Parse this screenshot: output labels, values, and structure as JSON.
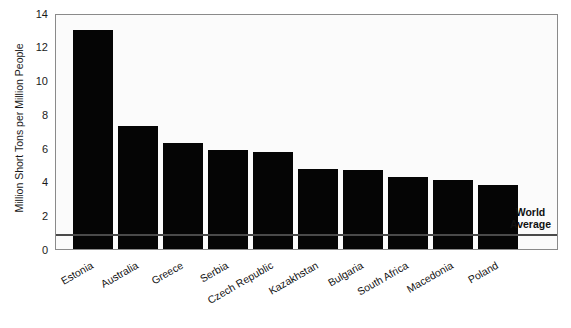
{
  "chart_data": {
    "type": "bar",
    "title": "",
    "subtitle": "",
    "xlabel": "",
    "ylabel": "Million Short Tons per Million People",
    "categories": [
      "Estonia",
      "Australia",
      "Greece",
      "Serbia",
      "Czech Republic",
      "Kazakhstan",
      "Bulgaria",
      "South Africa",
      "Macedonia",
      "Poland"
    ],
    "values": [
      13.0,
      7.3,
      6.3,
      5.9,
      5.75,
      4.75,
      4.7,
      4.3,
      4.1,
      3.8
    ],
    "ylim": [
      0,
      14
    ],
    "yticks": [
      0,
      2,
      4,
      6,
      8,
      10,
      12,
      14
    ],
    "ytick_labels": [
      "0",
      "2",
      "4",
      "6",
      "8",
      "10",
      "12",
      "14"
    ],
    "grid": false,
    "legend_position": "none",
    "bar_color": "#050505",
    "annotations": [
      {
        "name": "world-average",
        "label_line1": "World",
        "label_line2": "Average",
        "value": 1.0,
        "style": "horizontal-line",
        "color": "#4a4a4a"
      }
    ]
  }
}
